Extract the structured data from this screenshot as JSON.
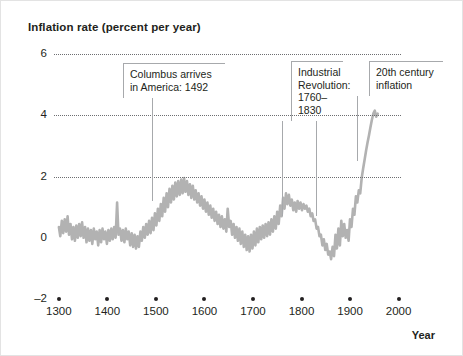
{
  "chart_data": {
    "type": "line",
    "title": "Inflation rate (percent per year)",
    "xlabel": "Year",
    "ylabel": "Inflation rate (percent per year)",
    "xlim": [
      1290,
      2005
    ],
    "ylim": [
      -2,
      6
    ],
    "yticks": [
      -2,
      0,
      2,
      4,
      6
    ],
    "ytick_labels": [
      "–2",
      "0",
      "2",
      "4",
      "6"
    ],
    "gridlines_at": [
      2,
      4,
      6
    ],
    "grid": "horizontal dotted at 2, 4 and 6",
    "xticks": [
      1300,
      1400,
      1500,
      1600,
      1700,
      1800,
      1900,
      2000
    ],
    "xtick_labels": [
      "1300",
      "1400",
      "1500",
      "1600",
      "1700",
      "1800",
      "1900",
      "2000"
    ],
    "legend": "none",
    "series": [
      {
        "name": "Inflation rate",
        "color": "#b2b2b2",
        "points": [
          [
            1300,
            0.35
          ],
          [
            1303,
            0.05
          ],
          [
            1306,
            0.55
          ],
          [
            1309,
            0.15
          ],
          [
            1312,
            0.6
          ],
          [
            1315,
            0.2
          ],
          [
            1318,
            0.7
          ],
          [
            1321,
            0.1
          ],
          [
            1324,
            0.45
          ],
          [
            1327,
            -0.05
          ],
          [
            1330,
            0.35
          ],
          [
            1333,
            -0.1
          ],
          [
            1336,
            0.4
          ],
          [
            1339,
            0.0
          ],
          [
            1342,
            0.45
          ],
          [
            1345,
            0.05
          ],
          [
            1348,
            0.5
          ],
          [
            1351,
            0.0
          ],
          [
            1354,
            0.35
          ],
          [
            1357,
            -0.15
          ],
          [
            1360,
            0.3
          ],
          [
            1363,
            -0.1
          ],
          [
            1366,
            0.25
          ],
          [
            1369,
            -0.2
          ],
          [
            1372,
            0.3
          ],
          [
            1375,
            -0.05
          ],
          [
            1378,
            0.2
          ],
          [
            1381,
            -0.25
          ],
          [
            1384,
            0.25
          ],
          [
            1387,
            -0.15
          ],
          [
            1390,
            0.3
          ],
          [
            1393,
            -0.05
          ],
          [
            1396,
            0.2
          ],
          [
            1399,
            -0.2
          ],
          [
            1402,
            0.25
          ],
          [
            1405,
            -0.1
          ],
          [
            1408,
            0.3
          ],
          [
            1411,
            -0.05
          ],
          [
            1414,
            0.35
          ],
          [
            1417,
            0.0
          ],
          [
            1420,
            1.15
          ],
          [
            1423,
            0.1
          ],
          [
            1426,
            0.3
          ],
          [
            1429,
            -0.1
          ],
          [
            1432,
            0.25
          ],
          [
            1435,
            -0.15
          ],
          [
            1438,
            0.3
          ],
          [
            1441,
            -0.05
          ],
          [
            1444,
            0.2
          ],
          [
            1447,
            -0.25
          ],
          [
            1450,
            0.15
          ],
          [
            1453,
            -0.3
          ],
          [
            1456,
            0.1
          ],
          [
            1459,
            -0.35
          ],
          [
            1462,
            0.05
          ],
          [
            1465,
            -0.3
          ],
          [
            1468,
            0.2
          ],
          [
            1471,
            -0.1
          ],
          [
            1474,
            0.35
          ],
          [
            1477,
            0.0
          ],
          [
            1480,
            0.45
          ],
          [
            1483,
            0.1
          ],
          [
            1486,
            0.55
          ],
          [
            1489,
            0.15
          ],
          [
            1492,
            0.65
          ],
          [
            1495,
            0.25
          ],
          [
            1498,
            0.8
          ],
          [
            1501,
            0.4
          ],
          [
            1504,
            0.95
          ],
          [
            1507,
            0.55
          ],
          [
            1510,
            1.1
          ],
          [
            1513,
            0.7
          ],
          [
            1516,
            1.3
          ],
          [
            1519,
            0.85
          ],
          [
            1522,
            1.45
          ],
          [
            1525,
            1.0
          ],
          [
            1528,
            1.6
          ],
          [
            1531,
            1.15
          ],
          [
            1534,
            1.7
          ],
          [
            1537,
            1.25
          ],
          [
            1540,
            1.8
          ],
          [
            1543,
            1.35
          ],
          [
            1546,
            1.85
          ],
          [
            1549,
            1.4
          ],
          [
            1552,
            1.9
          ],
          [
            1555,
            1.45
          ],
          [
            1558,
            1.95
          ],
          [
            1561,
            1.5
          ],
          [
            1564,
            1.85
          ],
          [
            1567,
            1.4
          ],
          [
            1570,
            1.75
          ],
          [
            1573,
            1.3
          ],
          [
            1576,
            1.7
          ],
          [
            1579,
            1.25
          ],
          [
            1582,
            1.55
          ],
          [
            1585,
            1.15
          ],
          [
            1588,
            1.45
          ],
          [
            1591,
            1.05
          ],
          [
            1594,
            1.35
          ],
          [
            1597,
            0.95
          ],
          [
            1600,
            1.25
          ],
          [
            1603,
            0.85
          ],
          [
            1606,
            1.15
          ],
          [
            1609,
            0.75
          ],
          [
            1612,
            1.05
          ],
          [
            1615,
            0.65
          ],
          [
            1618,
            0.95
          ],
          [
            1621,
            0.55
          ],
          [
            1624,
            0.85
          ],
          [
            1627,
            0.45
          ],
          [
            1630,
            0.75
          ],
          [
            1633,
            0.35
          ],
          [
            1636,
            0.7
          ],
          [
            1639,
            0.3
          ],
          [
            1642,
            0.6
          ],
          [
            1645,
            0.2
          ],
          [
            1648,
            0.95
          ],
          [
            1651,
            0.35
          ],
          [
            1654,
            0.55
          ],
          [
            1657,
            0.1
          ],
          [
            1660,
            0.45
          ],
          [
            1663,
            0.0
          ],
          [
            1666,
            0.35
          ],
          [
            1669,
            -0.1
          ],
          [
            1672,
            0.3
          ],
          [
            1675,
            -0.2
          ],
          [
            1678,
            0.2
          ],
          [
            1681,
            -0.3
          ],
          [
            1684,
            0.1
          ],
          [
            1687,
            -0.4
          ],
          [
            1690,
            0.05
          ],
          [
            1693,
            -0.45
          ],
          [
            1696,
            0.1
          ],
          [
            1699,
            -0.35
          ],
          [
            1702,
            0.2
          ],
          [
            1705,
            -0.25
          ],
          [
            1708,
            0.3
          ],
          [
            1711,
            -0.15
          ],
          [
            1714,
            0.35
          ],
          [
            1717,
            -0.05
          ],
          [
            1720,
            0.4
          ],
          [
            1723,
            0.0
          ],
          [
            1726,
            0.45
          ],
          [
            1729,
            0.05
          ],
          [
            1732,
            0.5
          ],
          [
            1735,
            0.1
          ],
          [
            1738,
            0.6
          ],
          [
            1741,
            0.2
          ],
          [
            1744,
            0.7
          ],
          [
            1747,
            0.3
          ],
          [
            1750,
            0.85
          ],
          [
            1753,
            0.45
          ],
          [
            1756,
            1.05
          ],
          [
            1759,
            0.7
          ],
          [
            1762,
            1.3
          ],
          [
            1765,
            0.95
          ],
          [
            1768,
            1.45
          ],
          [
            1771,
            1.1
          ],
          [
            1774,
            1.4
          ],
          [
            1777,
            1.05
          ],
          [
            1780,
            1.25
          ],
          [
            1783,
            0.9
          ],
          [
            1786,
            1.15
          ],
          [
            1789,
            0.85
          ],
          [
            1792,
            1.2
          ],
          [
            1795,
            0.95
          ],
          [
            1798,
            1.15
          ],
          [
            1801,
            0.9
          ],
          [
            1804,
            1.1
          ],
          [
            1807,
            0.95
          ],
          [
            1810,
            1.05
          ],
          [
            1813,
            0.85
          ],
          [
            1816,
            0.95
          ],
          [
            1819,
            0.7
          ],
          [
            1822,
            0.8
          ],
          [
            1825,
            0.55
          ],
          [
            1828,
            0.6
          ],
          [
            1831,
            0.3
          ],
          [
            1834,
            0.35
          ],
          [
            1837,
            0.05
          ],
          [
            1840,
            0.1
          ],
          [
            1843,
            -0.25
          ],
          [
            1846,
            -0.05
          ],
          [
            1849,
            -0.4
          ],
          [
            1852,
            -0.2
          ],
          [
            1855,
            -0.55
          ],
          [
            1858,
            -0.45
          ],
          [
            1861,
            -0.7
          ],
          [
            1864,
            -0.3
          ],
          [
            1867,
            -0.6
          ],
          [
            1870,
            0.1
          ],
          [
            1873,
            -0.35
          ],
          [
            1876,
            0.3
          ],
          [
            1879,
            -0.25
          ],
          [
            1882,
            0.55
          ],
          [
            1885,
            0.05
          ],
          [
            1888,
            0.45
          ],
          [
            1891,
            0.0
          ],
          [
            1894,
            0.25
          ],
          [
            1897,
            -0.1
          ],
          [
            1900,
            0.6
          ],
          [
            1903,
            0.35
          ],
          [
            1906,
            0.95
          ],
          [
            1909,
            0.75
          ],
          [
            1912,
            1.35
          ],
          [
            1915,
            1.15
          ],
          [
            1918,
            1.55
          ],
          [
            1921,
            1.45
          ],
          [
            1924,
            1.95
          ],
          [
            1927,
            2.25
          ],
          [
            1930,
            2.55
          ],
          [
            1933,
            2.85
          ],
          [
            1936,
            3.1
          ],
          [
            1939,
            3.35
          ],
          [
            1942,
            3.6
          ],
          [
            1945,
            3.85
          ],
          [
            1948,
            4.05
          ],
          [
            1951,
            4.15
          ],
          [
            1954,
            3.95
          ],
          [
            1957,
            4.05
          ]
        ]
      }
    ],
    "annotations": [
      {
        "id": "columbus",
        "text": "Columbus arrives\nin America: 1492",
        "points_to_year": 1492,
        "leader_years": [
          1492
        ]
      },
      {
        "id": "industrial-revolution",
        "text": "Industrial\nRevolution:\n1760–1830",
        "points_to_year": 1760,
        "leader_years": [
          1760,
          1830
        ]
      },
      {
        "id": "twentieth-century-inflation",
        "text": "20th century\ninflation",
        "points_to_year": 1915,
        "leader_years": [
          1915
        ]
      }
    ],
    "colors": {
      "series": "#b2b2b2",
      "grid": "#6d6e71",
      "text": "#231f20",
      "annotation_border": "#a7a9ac",
      "background": "#ffffff"
    }
  }
}
